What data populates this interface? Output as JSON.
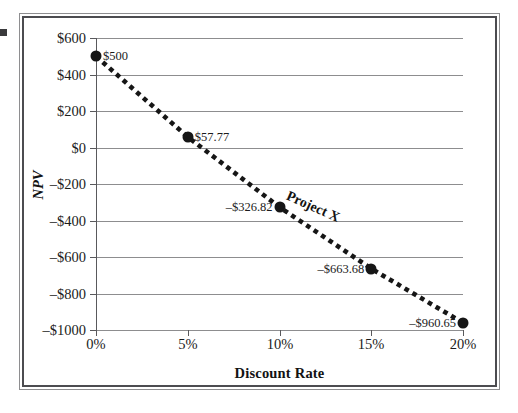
{
  "figure": {
    "caption_visible": false
  },
  "chart_data": {
    "type": "line",
    "title": "",
    "xlabel": "Discount Rate",
    "ylabel": "NPV",
    "series_name": "Project X",
    "x": [
      0,
      5,
      10,
      15,
      20
    ],
    "x_tick_labels": [
      "0%",
      "5%",
      "10%",
      "15%",
      "20%"
    ],
    "values": [
      500,
      57.77,
      -326.82,
      -663.68,
      -960.65
    ],
    "point_labels": [
      "$500",
      "$57.77",
      "–$326.82",
      "–$663.68",
      "–$960.65"
    ],
    "point_label_side": [
      "right",
      "right",
      "left",
      "left",
      "left"
    ],
    "y_tick_values": [
      600,
      400,
      200,
      0,
      -200,
      -400,
      -600,
      -800,
      -1000
    ],
    "y_tick_labels": [
      "$600",
      "$400",
      "$200",
      "$0",
      "–$200",
      "–$400",
      "–$600",
      "–$800",
      "–$1000"
    ],
    "xlim": [
      0,
      20
    ],
    "ylim": [
      -1000,
      600
    ],
    "grid": "horizontal",
    "legend": "none",
    "annotations": [
      {
        "text": "Project X",
        "x": 11.8,
        "y": -325,
        "rotation_deg": 24
      }
    ],
    "line_style": "dotted",
    "line_color": "#161616",
    "marker_style": "circle",
    "marker_color": "#161616",
    "grid_color": "#8d8d8f",
    "background_color": "#ffffff"
  }
}
